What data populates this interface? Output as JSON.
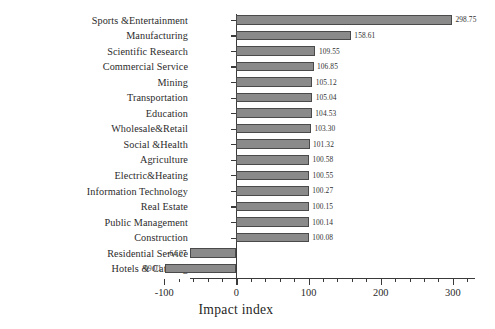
{
  "chart_data": {
    "type": "bar",
    "orientation": "horizontal",
    "title": "",
    "xlabel": "Impact index",
    "ylabel": "",
    "xlim": [
      -120,
      320
    ],
    "xticks": [
      -100,
      0,
      100,
      200,
      300
    ],
    "xtick_labels": [
      "-100",
      "0",
      "100",
      "200",
      "300"
    ],
    "grid": false,
    "legend": null,
    "minor_ticks_per_major": 5,
    "bar_color": "#8a8a8a",
    "bar_edge_color": "#4a4a4a",
    "axis_color": "#3a3a3a",
    "categories": [
      "Sports &Entertainment",
      "Manufacturing",
      "Scientific Research",
      "Commercial Service",
      "Mining",
      "Transportation",
      "Education",
      "Wholesale&Retail",
      "Social &Health",
      "Agriculture",
      "Electric&Heating",
      "Information Technology",
      "Real Estate",
      "Public Management",
      "Construction",
      "Residential Service",
      "Hotels & Catering"
    ],
    "values": [
      298.75,
      158.61,
      109.55,
      106.85,
      105.12,
      105.04,
      104.53,
      103.3,
      101.32,
      100.58,
      100.55,
      100.27,
      100.15,
      100.14,
      100.08,
      -64.07,
      -99.01
    ],
    "value_labels": [
      "298.75",
      "158.61",
      "109.55",
      "106.85",
      "105.12",
      "105.04",
      "104.53",
      "103.30",
      "101.32",
      "100.58",
      "100.55",
      "100.27",
      "100.15",
      "100.14",
      "100.08",
      "-64.07",
      "-99.01"
    ]
  }
}
